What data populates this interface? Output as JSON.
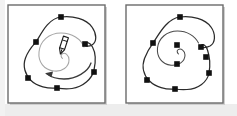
{
  "figure": {
    "width": 237,
    "height": 116,
    "background_color": "#ffffff",
    "panel_border_color": "#6b6b6b",
    "panel_fill_color": "#ffffff",
    "path_stroke_color": "#2b2b2b",
    "anchor_fill_color": "#111111",
    "spiral_stroke_color": "#8c8c8c",
    "arrow_color": "#3a3a3a",
    "pen_cursor_color": "#1a1a1a",
    "bottom_strip_color": "#e8e8e8",
    "shadow_color": "#cfcfcf",
    "caption": ""
  },
  "panels": [
    {
      "id": "panel-left",
      "name": "before-panel",
      "label": "",
      "frame": {
        "x": 8,
        "y": 5,
        "width": 97,
        "height": 98
      },
      "outline_path": "M 61 17 C 78 15 94 24 95 38 C 96 48 86 50 85 44 C 84 36 92 38 94 48 C 96 60 96 66 94 72 C 92 80 80 88 70 89 C 62 90 57 88 57 88 C 48 89 36 86 30 80 C 24 74 22 66 25 58 C 28 48 32 46 36 42 C 41 37 47 20 61 17 Z",
      "anchors": [
        {
          "x": 61,
          "y": 17,
          "name": "anchor-top"
        },
        {
          "x": 36,
          "y": 42,
          "name": "anchor-upper-left"
        },
        {
          "x": 85,
          "y": 44,
          "name": "anchor-upper-right"
        },
        {
          "x": 94,
          "y": 72,
          "name": "anchor-right"
        },
        {
          "x": 28,
          "y": 78,
          "name": "anchor-lower-left"
        },
        {
          "x": 57,
          "y": 88,
          "name": "anchor-bottom"
        }
      ],
      "spiral": {
        "center_x": 62,
        "center_y": 58,
        "turns": 1.75,
        "start_radius": 3,
        "end_radius": 22,
        "visible": true
      },
      "pen_cursor": {
        "x": 63,
        "y": 44,
        "rotation_deg": 20,
        "visible": true
      },
      "rotation_arrow": {
        "visible": true,
        "direction": "counter-clockwise"
      },
      "anchor_count": 6
    },
    {
      "id": "panel-right",
      "name": "after-panel",
      "label": "",
      "frame": {
        "x": 126,
        "y": 5,
        "width": 97,
        "height": 98
      },
      "outline_path": "M 180 17 C 197 15 212 24 213 38 C 214 47 204 52 201 47 C 198 41 203 40 206 47 C 209 54 210 64 209 73 C 208 82 196 89 186 89 C 180 89 176 89 175 89 C 166 90 154 87 148 81 C 142 74 140 66 143 58 C 146 49 150 47 153 43 C 159 37 166 20 180 17 Z",
      "anchors": [
        {
          "x": 180,
          "y": 17,
          "name": "anchor-top"
        },
        {
          "x": 153,
          "y": 43,
          "name": "anchor-upper-left"
        },
        {
          "x": 177,
          "y": 45,
          "name": "anchor-inner-upper"
        },
        {
          "x": 201,
          "y": 47,
          "name": "anchor-upper-right"
        },
        {
          "x": 206,
          "y": 57,
          "name": "anchor-mid-right"
        },
        {
          "x": 177,
          "y": 64,
          "name": "anchor-inner-lower"
        },
        {
          "x": 209,
          "y": 73,
          "name": "anchor-right"
        },
        {
          "x": 147,
          "y": 80,
          "name": "anchor-lower-left"
        },
        {
          "x": 175,
          "y": 89,
          "name": "anchor-bottom"
        }
      ],
      "spiral": {
        "center_x": 179,
        "center_y": 54,
        "turns": 1.75,
        "start_radius": 2,
        "end_radius": 22,
        "visible": true
      },
      "pen_cursor": {
        "x": 0,
        "y": 0,
        "rotation_deg": 0,
        "visible": false
      },
      "rotation_arrow": {
        "visible": false,
        "direction": ""
      },
      "anchor_count": 9
    }
  ]
}
